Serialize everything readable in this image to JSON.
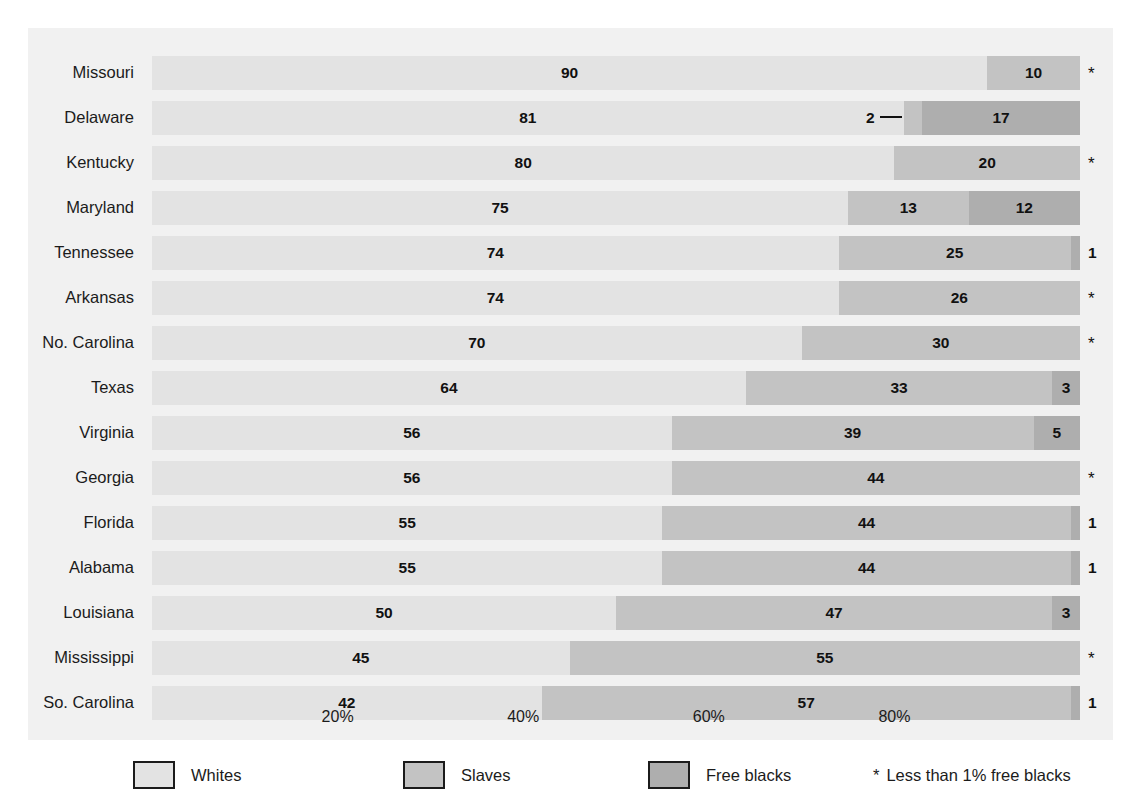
{
  "chart_data": {
    "type": "bar",
    "orientation": "horizontal",
    "stacked": true,
    "normalized_percent": true,
    "title": "",
    "subtitle": "",
    "xlabel": "",
    "ylabel": "",
    "xlim": [
      0,
      100
    ],
    "grid": false,
    "legend_position": "bottom",
    "categories": [
      "Missouri",
      "Delaware",
      "Kentucky",
      "Maryland",
      "Tennessee",
      "Arkansas",
      "No. Carolina",
      "Texas",
      "Virginia",
      "Georgia",
      "Florida",
      "Alabama",
      "Louisiana",
      "Mississippi",
      "So. Carolina"
    ],
    "series": [
      {
        "name": "Whites",
        "color": "#e3e3e3",
        "values": [
          90,
          81,
          80,
          75,
          74,
          74,
          70,
          64,
          56,
          56,
          55,
          55,
          50,
          45,
          42
        ]
      },
      {
        "name": "Slaves",
        "color": "#c3c3c3",
        "values": [
          10,
          2,
          20,
          13,
          25,
          26,
          30,
          33,
          39,
          44,
          44,
          44,
          47,
          55,
          57
        ]
      },
      {
        "name": "Free blacks",
        "color": "#aeaeae",
        "values": [
          0,
          17,
          0,
          12,
          1,
          0,
          0,
          3,
          5,
          0,
          1,
          1,
          3,
          0,
          1
        ]
      }
    ],
    "xticks": [
      20,
      40,
      60,
      80
    ],
    "xticklabels": [
      "20%",
      "40%",
      "60%",
      "80%"
    ],
    "annotations": [
      "Delaware slaves segment (2%) labelled outside the bar with a leader line",
      "Asterisk denotes less than 1% free blacks"
    ]
  },
  "rows": [
    {
      "label": "Missouri",
      "segments": [
        {
          "series": "Whites",
          "value": 90,
          "value_label": "90",
          "label_inside": true
        },
        {
          "series": "Slaves",
          "value": 10,
          "value_label": "10",
          "label_inside": true
        }
      ],
      "marker": "*",
      "marker_kind": "star"
    },
    {
      "label": "Delaware",
      "segments": [
        {
          "series": "Whites",
          "value": 81,
          "value_label": "81",
          "label_inside": true
        },
        {
          "series": "Slaves",
          "value": 2,
          "value_label": "2",
          "label_inside": false
        },
        {
          "series": "Free blacks",
          "value": 17,
          "value_label": "17",
          "label_inside": true
        }
      ],
      "marker": "",
      "marker_kind": "none"
    },
    {
      "label": "Kentucky",
      "segments": [
        {
          "series": "Whites",
          "value": 80,
          "value_label": "80",
          "label_inside": true
        },
        {
          "series": "Slaves",
          "value": 20,
          "value_label": "20",
          "label_inside": true
        }
      ],
      "marker": "*",
      "marker_kind": "star"
    },
    {
      "label": "Maryland",
      "segments": [
        {
          "series": "Whites",
          "value": 75,
          "value_label": "75",
          "label_inside": true
        },
        {
          "series": "Slaves",
          "value": 13,
          "value_label": "13",
          "label_inside": true
        },
        {
          "series": "Free blacks",
          "value": 12,
          "value_label": "12",
          "label_inside": true
        }
      ],
      "marker": "",
      "marker_kind": "none"
    },
    {
      "label": "Tennessee",
      "segments": [
        {
          "series": "Whites",
          "value": 74,
          "value_label": "74",
          "label_inside": true
        },
        {
          "series": "Slaves",
          "value": 25,
          "value_label": "25",
          "label_inside": true
        },
        {
          "series": "Free blacks",
          "value": 1,
          "value_label": "",
          "label_inside": true
        }
      ],
      "marker": "1",
      "marker_kind": "number"
    },
    {
      "label": "Arkansas",
      "segments": [
        {
          "series": "Whites",
          "value": 74,
          "value_label": "74",
          "label_inside": true
        },
        {
          "series": "Slaves",
          "value": 26,
          "value_label": "26",
          "label_inside": true
        }
      ],
      "marker": "*",
      "marker_kind": "star"
    },
    {
      "label": "No. Carolina",
      "segments": [
        {
          "series": "Whites",
          "value": 70,
          "value_label": "70",
          "label_inside": true
        },
        {
          "series": "Slaves",
          "value": 30,
          "value_label": "30",
          "label_inside": true
        }
      ],
      "marker": "*",
      "marker_kind": "star"
    },
    {
      "label": "Texas",
      "segments": [
        {
          "series": "Whites",
          "value": 64,
          "value_label": "64",
          "label_inside": true
        },
        {
          "series": "Slaves",
          "value": 33,
          "value_label": "33",
          "label_inside": true
        },
        {
          "series": "Free blacks",
          "value": 3,
          "value_label": "3",
          "label_inside": true
        }
      ],
      "marker": "",
      "marker_kind": "none"
    },
    {
      "label": "Virginia",
      "segments": [
        {
          "series": "Whites",
          "value": 56,
          "value_label": "56",
          "label_inside": true
        },
        {
          "series": "Slaves",
          "value": 39,
          "value_label": "39",
          "label_inside": true
        },
        {
          "series": "Free blacks",
          "value": 5,
          "value_label": "5",
          "label_inside": true
        }
      ],
      "marker": "",
      "marker_kind": "none"
    },
    {
      "label": "Georgia",
      "segments": [
        {
          "series": "Whites",
          "value": 56,
          "value_label": "56",
          "label_inside": true
        },
        {
          "series": "Slaves",
          "value": 44,
          "value_label": "44",
          "label_inside": true
        }
      ],
      "marker": "*",
      "marker_kind": "star"
    },
    {
      "label": "Florida",
      "segments": [
        {
          "series": "Whites",
          "value": 55,
          "value_label": "55",
          "label_inside": true
        },
        {
          "series": "Slaves",
          "value": 44,
          "value_label": "44",
          "label_inside": true
        },
        {
          "series": "Free blacks",
          "value": 1,
          "value_label": "",
          "label_inside": true
        }
      ],
      "marker": "1",
      "marker_kind": "number"
    },
    {
      "label": "Alabama",
      "segments": [
        {
          "series": "Whites",
          "value": 55,
          "value_label": "55",
          "label_inside": true
        },
        {
          "series": "Slaves",
          "value": 44,
          "value_label": "44",
          "label_inside": true
        },
        {
          "series": "Free blacks",
          "value": 1,
          "value_label": "",
          "label_inside": true
        }
      ],
      "marker": "1",
      "marker_kind": "number"
    },
    {
      "label": "Louisiana",
      "segments": [
        {
          "series": "Whites",
          "value": 50,
          "value_label": "50",
          "label_inside": true
        },
        {
          "series": "Slaves",
          "value": 47,
          "value_label": "47",
          "label_inside": true
        },
        {
          "series": "Free blacks",
          "value": 3,
          "value_label": "3",
          "label_inside": true
        }
      ],
      "marker": "",
      "marker_kind": "none"
    },
    {
      "label": "Mississippi",
      "segments": [
        {
          "series": "Whites",
          "value": 45,
          "value_label": "45",
          "label_inside": true
        },
        {
          "series": "Slaves",
          "value": 55,
          "value_label": "55",
          "label_inside": true
        }
      ],
      "marker": "*",
      "marker_kind": "star"
    },
    {
      "label": "So. Carolina",
      "segments": [
        {
          "series": "Whites",
          "value": 42,
          "value_label": "42",
          "label_inside": true
        },
        {
          "series": "Slaves",
          "value": 57,
          "value_label": "57",
          "label_inside": true
        },
        {
          "series": "Free blacks",
          "value": 1,
          "value_label": "",
          "label_inside": true
        }
      ],
      "marker": "1",
      "marker_kind": "number"
    }
  ],
  "axis": {
    "ticks": [
      {
        "value": 20,
        "label": "20%"
      },
      {
        "value": 40,
        "label": "40%"
      },
      {
        "value": 60,
        "label": "60%"
      },
      {
        "value": 80,
        "label": "80%"
      }
    ]
  },
  "legend": {
    "items": [
      {
        "label": "Whites",
        "swatch": "sw-whites",
        "color": "#e3e3e3"
      },
      {
        "label": "Slaves",
        "swatch": "sw-slaves",
        "color": "#c3c3c3"
      },
      {
        "label": "Free blacks",
        "swatch": "sw-freeblacks",
        "color": "#aeaeae"
      }
    ],
    "note_symbol": "*",
    "note_text": "Less than 1% free blacks"
  },
  "style": {
    "series_colors": {
      "Whites": "#e3e3e3",
      "Slaves": "#c3c3c3",
      "Free blacks": "#aeaeae"
    },
    "panel_background": "#f1f1f1",
    "page_background": "#ffffff",
    "text_color": "#1b1b1b"
  }
}
